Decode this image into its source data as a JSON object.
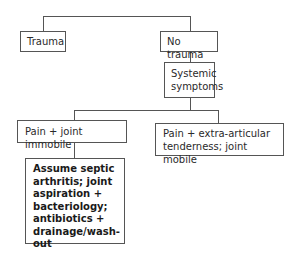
{
  "diagram": {
    "nodes": {
      "trauma": "Trauma",
      "no_trauma": "No trauma",
      "systemic": "Systemic symptoms",
      "pain_immobile": "Pain + joint immobile",
      "pain_mobile": "Pain + extra-articular tenderness; joint mobile",
      "septic": "Assume septic arthritis; joint aspiration + bacteriology; antibiotics + drainage/wash-out"
    },
    "edges": [
      [
        "root",
        "trauma"
      ],
      [
        "root",
        "no_trauma"
      ],
      [
        "no_trauma",
        "systemic"
      ],
      [
        "systemic",
        "pain_immobile"
      ],
      [
        "systemic",
        "pain_mobile"
      ],
      [
        "pain_immobile",
        "septic"
      ]
    ]
  }
}
